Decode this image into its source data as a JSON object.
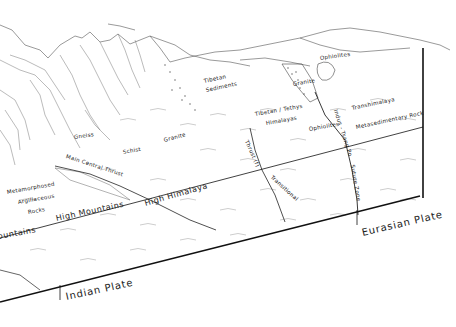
{
  "figure": {
    "type": "geological block diagram"
  },
  "labels": {
    "tibetan_sediments": [
      "Tibetan",
      "Sediments"
    ],
    "ophiolites_top": "Ophiolites",
    "granite_upper": "Granite",
    "tibetan_tethys": [
      "Tibetan / Tethys",
      "Himalayas"
    ],
    "ophiolites_lower": "Ophiolites",
    "transhimalaya": "Transhimalaya",
    "metasedimentary": "Metasedimentary Rock",
    "indus_tsang_po": "Indus - Tsang Po",
    "suture_zone": "Suture Zone",
    "gneiss": "Gneiss",
    "schist": "Schist",
    "granite_lower": "Granite",
    "main_central_thrust": "Main Central Thrust",
    "thrust_fault": "Thrust (f)",
    "transitional": "Transitional",
    "metamorphosed": [
      "Metamorphosed",
      "Argillaceous",
      "Rocks"
    ],
    "high_himalaya": "High  Himalaya",
    "high_mountains": "High  Mountains",
    "mountains_left": "ountains",
    "indian_plate": "Indian    Plate",
    "eurasian_plate": "Eurasian Plate"
  },
  "colors": {
    "line": "#222222",
    "hatch": "#8a8a8a",
    "background": "#ffffff"
  }
}
